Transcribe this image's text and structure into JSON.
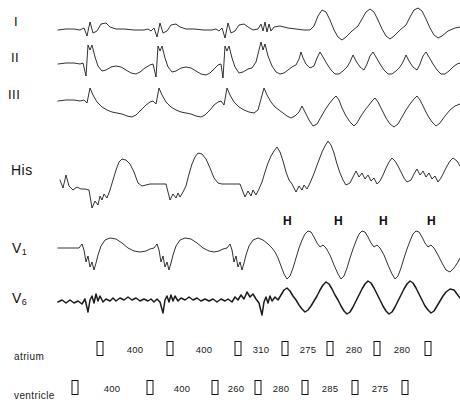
{
  "figure": {
    "type": "electrophysiology-recording",
    "background_color": "#ffffff",
    "trace_color": "#1b1b1b",
    "width": 460,
    "height": 410
  },
  "channels": [
    {
      "id": "lead-i",
      "label": "I",
      "kind": "surface-ecg",
      "baseline_y": 30,
      "label_x": 14,
      "label_y": 14
    },
    {
      "id": "lead-ii",
      "label": "II",
      "kind": "surface-ecg",
      "baseline_y": 65,
      "label_x": 11,
      "label_y": 50
    },
    {
      "id": "lead-iii",
      "label": "III",
      "kind": "surface-ecg",
      "baseline_y": 102,
      "label_x": 8,
      "label_y": 87
    },
    {
      "id": "his",
      "label": "His",
      "kind": "intracardiac",
      "baseline_y": 190,
      "label_x": 11,
      "label_y": 162
    },
    {
      "id": "v1",
      "label": "V",
      "sub": "1",
      "kind": "surface-ecg",
      "baseline_y": 248,
      "label_x": 12,
      "label_y": 240
    },
    {
      "id": "v6",
      "label": "V",
      "sub": "6",
      "kind": "surface-ecg",
      "baseline_y": 300,
      "label_x": 12,
      "label_y": 290
    }
  ],
  "his_annotations": {
    "symbol": "H",
    "count": 4,
    "positions_x": [
      283,
      334,
      379,
      427
    ],
    "y": 214
  },
  "timing_rows": [
    {
      "id": "atrium",
      "label": "atrium",
      "label_x": 14,
      "label_y": 351,
      "marker_y": 341,
      "number_y": 344,
      "markers_x": [
        100,
        170,
        238,
        285,
        330,
        377,
        428
      ],
      "intervals": [
        {
          "value": "400",
          "x": 135
        },
        {
          "value": "400",
          "x": 204
        },
        {
          "value": "310",
          "x": 261
        },
        {
          "value": "275",
          "x": 308
        },
        {
          "value": "280",
          "x": 354
        },
        {
          "value": "280",
          "x": 402
        }
      ]
    },
    {
      "id": "ventricle",
      "label": "ventricle",
      "label_x": 14,
      "label_y": 390,
      "marker_y": 380,
      "number_y": 383,
      "markers_x": [
        75,
        150,
        215,
        258,
        305,
        355,
        405
      ],
      "intervals": [
        {
          "value": "400",
          "x": 112
        },
        {
          "value": "400",
          "x": 182
        },
        {
          "value": "260",
          "x": 236
        },
        {
          "value": "280",
          "x": 281
        },
        {
          "value": "285",
          "x": 330
        },
        {
          "value": "275",
          "x": 380
        }
      ]
    }
  ],
  "chart_data": {
    "type": "line",
    "title": "",
    "xlabel": "",
    "ylabel": "",
    "series": [
      {
        "name": "I",
        "points": "58,30 66,29 74,29 80,30 84,28 87,36 90,22 93,33 97,31 101,24 106,23 110,27 116,29 124,29 134,30 144,30 148,29 151,31 154,28 157,37 160,23 163,33 167,31 171,25 176,24 180,27 186,29 194,29 204,30 212,30 216,29 219,31 222,28 225,38 228,23 231,33 235,31 239,25 244,24 248,27 253,30 258,29 261,24 263,31 265,22 267,32 269,24 271,31 274,27 280,26 288,28 296,29 304,30 310,30 314,26 318,16 322,10 326,12 330,20 334,30 338,37 342,40 346,37 352,31 358,26 362,19 366,12 370,9 374,12 378,20 382,29 386,36 390,39 394,36 400,30 406,25 410,17 414,10 418,8 422,11 426,19 430,28 434,35 438,38 442,36 448,31 455,28 460,27"
      },
      {
        "name": "II",
        "points": "58,64 66,63 74,63 80,64 83,63 86,76 88,45 90,50 92,45 95,57 98,66 102,71 106,70 111,67 116,66 121,67 126,70 131,73 136,74 140,72 145,68 150,65 153,64 156,77 158,46 160,51 162,46 165,58 168,67 172,72 176,71 181,68 186,67 191,68 196,71 201,74 206,75 210,73 214,69 218,65 221,64 223,78 225,46 227,51 229,46 232,58 235,67 239,73 243,72 248,69 252,68 256,62 259,50 261,42 263,50 265,44 268,56 272,66 276,72 280,74 284,73 288,70 292,67 296,65 299,59 301,52 303,58 306,64 310,68 314,66 317,58 320,52 323,57 327,64 331,70 335,74 339,74 343,71 347,67 350,62 353,55 356,61 360,67 364,70 367,64 370,56 373,52 376,57 380,64 384,70 388,74 392,74 396,71 400,67 403,62 406,55 409,61 413,67 417,70 420,64 423,56 426,52 429,57 433,64 437,70 441,74 445,74 449,71 453,67 457,64 460,63"
      },
      {
        "name": "III",
        "points": "58,101 66,100 74,100 80,101 84,100 87,103 90,88 93,95 97,102 102,107 107,110 112,112 117,113 122,114 127,116 132,117 136,115 141,110 146,105 150,102 153,101 156,104 159,88 162,95 166,102 171,107 176,110 181,112 186,113 191,114 196,116 201,117 205,115 210,110 214,105 218,102 221,101 224,105 227,88 230,95 234,102 239,107 244,110 249,112 254,113 258,110 261,99 264,88 267,95 271,102 275,107 279,110 283,113 287,116 291,118 295,116 299,112 302,106 305,112 309,120 313,126 317,124 321,117 325,110 329,104 333,99 336,96 339,100 342,108 346,116 350,122 354,126 357,123 361,116 365,110 369,105 372,101 375,98 378,102 382,110 386,118 390,124 394,127 398,124 402,117 406,110 410,104 414,99 417,96 420,100 424,108 428,116 432,122 436,126 440,123 445,116 450,110 455,106 460,104"
      },
      {
        "name": "His",
        "points": "60,180 63,188 66,175 69,186 73,190 77,187 81,189 85,189 89,190 92,208 95,201 98,205 100,196 102,200 104,194 107,198 110,190 113,180 116,170 119,162 122,159 126,160 130,164 134,172 138,183 142,186 146,185 150,184 155,184 160,184 166,184 170,200 173,194 176,198 178,193 180,197 183,192 186,186 189,174 192,164 195,157 198,153 202,154 206,159 210,168 214,178 218,183 222,184 228,184 234,184 240,184 245,197 248,191 251,196 253,190 256,195 259,189 262,182 265,172 268,163 271,156 274,151 277,147 280,152 283,161 286,172 289,180 292,184 296,192 299,186 302,190 304,185 307,189 310,183 313,176 316,168 319,160 322,152 325,146 328,141 331,145 334,153 337,164 340,173 343,180 346,185 350,183 353,177 356,171 359,177 362,173 365,179 368,175 371,181 374,178 377,184 380,181 383,175 386,168 389,162 392,158 395,161 398,166 401,172 404,178 407,182 411,180 414,174 417,169 420,175 423,171 426,177 429,173 432,179 435,176 438,182 441,178 444,172 447,166 450,161 453,158 457,161 460,166"
      },
      {
        "name": "V1",
        "points": "58,248 66,248 74,248 79,248 82,244 84,250 86,262 88,256 90,267 92,262 94,270 96,263 98,255 101,246 105,240 110,238 116,239 122,243 128,248 134,251 140,252 146,251 150,249 154,248 157,244 159,250 161,262 163,256 165,267 167,262 169,270 171,263 173,255 176,246 180,240 185,238 191,239 197,243 203,248 209,251 214,252 219,251 223,249 227,248 230,244 232,250 234,262 236,256 238,267 240,262 242,270 244,263 246,255 249,246 253,240 258,238 263,240 268,244 272,248 275,252 278,258 281,266 284,274 287,279 290,276 293,268 296,258 299,248 302,240 305,234 308,231 311,232 314,237 317,243 320,247 323,245 326,248 330,255 334,265 338,274 341,279 344,276 347,268 350,258 353,249 356,241 359,234 362,231 365,232 368,237 371,243 374,247 377,245 380,248 384,255 388,265 392,274 395,279 398,276 401,268 404,258 407,249 410,241 413,234 416,231 419,232 422,237 425,243 428,247 431,245 434,248 438,255 442,263 446,270 450,272 454,268 458,262 460,258"
      },
      {
        "name": "V6",
        "points": "58,302 62,300 66,303 70,300 74,303 78,301 82,304 85,299 88,312 90,300 92,296 94,303 96,294 98,301 100,296 103,302 106,299 110,301 113,298 116,301 120,298 124,300 128,297 132,300 136,298 140,301 144,299 148,301 151,299 154,302 157,299 160,302 163,313 165,300 167,296 169,302 171,295 173,301 175,296 178,301 181,298 185,300 189,297 193,300 197,298 201,301 205,299 209,301 213,299 217,302 221,299 225,301 228,299 232,302 235,297 238,300 241,295 244,299 247,292 250,297 253,294 256,299 259,303 262,315 264,302 266,297 268,303 270,296 272,301 275,297 278,300 281,295 284,290 287,288 290,291 293,296 296,300 299,305 302,309 305,312 308,310 311,306 314,301 317,296 320,290 323,285 326,282 329,284 332,289 335,295 338,300 341,306 344,311 347,314 350,312 353,307 356,301 359,295 362,289 365,284 368,281 371,283 374,288 377,294 380,300 383,306 386,311 389,314 392,312 395,307 398,301 401,295 404,289 407,284 410,281 413,283 416,288 419,294 422,300 425,306 428,310 431,313 434,311 437,306 440,301 443,296 446,292 450,289 454,290 457,294 460,298"
      }
    ],
    "annotations": {
      "his_deflections": [
        "H",
        "H",
        "H",
        "H"
      ],
      "atrium_intervals_ms": [
        400,
        400,
        310,
        275,
        280,
        280
      ],
      "ventricle_intervals_ms": [
        400,
        400,
        260,
        280,
        285,
        275
      ]
    }
  }
}
